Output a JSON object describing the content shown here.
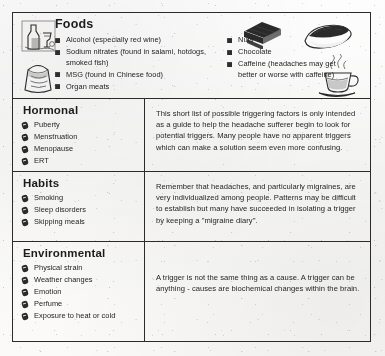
{
  "document": {
    "title": "Headache Trigger Factors Chart"
  },
  "sections": [
    {
      "id": "foods",
      "heading": "Foods",
      "bullet_style": "square",
      "items_left": [
        "Alcohol (especially red wine)",
        "Sodium nitrates (found in salami, hotdogs, smoked fish)",
        "MSG (found in Chinese food)",
        "Organ meats"
      ],
      "items_right": [
        "Nuts",
        "Chocolate",
        "Caffeine (headaches may get better or worse with caffeine)"
      ],
      "illustrations": [
        "wine-bottle-and-glass-illustration",
        "food-carton-illustration",
        "chocolate-bars-illustration",
        "hotdog-illustration",
        "coffee-cup-illustration"
      ]
    },
    {
      "id": "hormonal",
      "heading": "Hormonal",
      "bullet_style": "pill",
      "items": [
        "Puberty",
        "Menstruation",
        "Menopause",
        "ERT"
      ],
      "note": "This short list of possible triggering factors is only intended as a guide to help the headache sufferer begin to look for potential triggers. Many people have no apparent triggers which can make a solution seem even more confusing."
    },
    {
      "id": "habits",
      "heading": "Habits",
      "bullet_style": "pill",
      "items": [
        "Smoking",
        "Sleep disorders",
        "Skipping meals"
      ],
      "note": "Remember that headaches, and particularly migraines, are very individualized among people. Patterns may be difficult to establish but many have succeeded in isolating a trigger by keeping a \"migraine diary\"."
    },
    {
      "id": "environmental",
      "heading": "Environmental",
      "bullet_style": "pill",
      "items": [
        "Physical strain",
        "Weather changes",
        "Emotion",
        "Perfume",
        "Exposure to heat or cold"
      ],
      "note": "A trigger is not the same thing as a cause. A trigger can be anything - causes are biochemical changes within the brain."
    }
  ],
  "colors": {
    "ink": "#2a2a2a",
    "paper": "#fbfaf9",
    "border": "#2b2b2b"
  }
}
